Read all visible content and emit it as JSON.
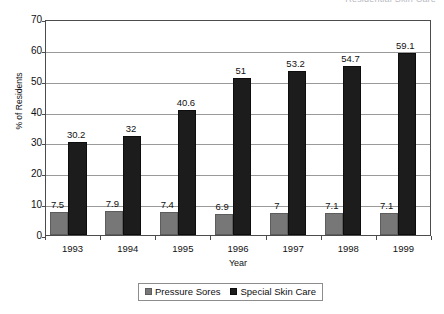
{
  "clipped_header": {
    "text": "Residential Skin Care"
  },
  "chart_data": {
    "type": "bar",
    "title": "",
    "xlabel": "Year",
    "ylabel": "% of Residents",
    "categories": [
      "1993",
      "1994",
      "1995",
      "1996",
      "1997",
      "1998",
      "1999"
    ],
    "series": [
      {
        "name": "Pressure Sores",
        "color": "#777777",
        "values": [
          7.5,
          7.9,
          7.4,
          6.9,
          7,
          7.1,
          7.1
        ],
        "labels": [
          "7.5",
          "7.9",
          "7.4",
          "6.9",
          "7",
          "7.1",
          "7.1"
        ]
      },
      {
        "name": "Special Skin Care",
        "color": "#1c1c1c",
        "values": [
          30.2,
          32,
          40.6,
          51,
          53.2,
          54.7,
          59.1
        ],
        "labels": [
          "30.2",
          "32",
          "40.6",
          "51",
          "53.2",
          "54.7",
          "59.1"
        ]
      }
    ],
    "ylim": [
      0,
      70
    ],
    "yticks": [
      "70",
      "60",
      "50",
      "40",
      "30",
      "20",
      "10",
      "0"
    ],
    "ytick_values": [
      70,
      60,
      50,
      40,
      30,
      20,
      10,
      0
    ],
    "grid": true,
    "legend_position": "bottom"
  }
}
